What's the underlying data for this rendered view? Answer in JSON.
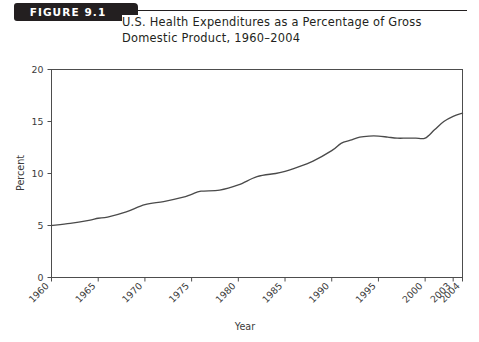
{
  "figure": {
    "badge_label": "FIGURE 9.1",
    "title_line_1": "U.S. Health Expenditures as a Percentage of Gross",
    "title_line_2": "Domestic Product, 1960–2004"
  },
  "colors": {
    "badge_background": "#231f20",
    "badge_text": "#ffffff",
    "title_text": "#231f20",
    "axis": "#4d4d4d",
    "line": "#4a4a4a",
    "background": "#ffffff"
  },
  "chart_data": {
    "type": "line",
    "title": "U.S. Health Expenditures as a Percentage of Gross Domestic Product, 1960–2004",
    "xlabel": "Year",
    "ylabel": "Percent",
    "xlim": [
      1960,
      2004
    ],
    "ylim": [
      0,
      20
    ],
    "grid": false,
    "legend": "none",
    "y_ticks": [
      0,
      5,
      10,
      15,
      20
    ],
    "y_tick_labels": [
      "0",
      "5",
      "10",
      "15",
      "20"
    ],
    "x_ticks": [
      1960,
      1965,
      1970,
      1975,
      1980,
      1985,
      1990,
      1995,
      2000,
      2003,
      2004
    ],
    "x_tick_labels": [
      "1960",
      "1965",
      "1970",
      "1975",
      "1980",
      "1985",
      "1990",
      "1995",
      "2000",
      "2003",
      "2004"
    ],
    "series": [
      {
        "name": "U.S. Health Expenditures as % of GDP",
        "x": [
          1960,
          1962,
          1964,
          1965,
          1966,
          1968,
          1970,
          1972,
          1974,
          1975,
          1976,
          1978,
          1980,
          1982,
          1984,
          1985,
          1986,
          1988,
          1990,
          1991,
          1992,
          1993,
          1994,
          1995,
          1996,
          1997,
          1998,
          1999,
          2000,
          2001,
          2002,
          2003,
          2004
        ],
        "values": [
          5.0,
          5.2,
          5.5,
          5.7,
          5.8,
          6.3,
          7.0,
          7.3,
          7.7,
          8.0,
          8.3,
          8.4,
          8.9,
          9.7,
          10.0,
          10.2,
          10.5,
          11.2,
          12.2,
          12.9,
          13.2,
          13.5,
          13.6,
          13.6,
          13.5,
          13.4,
          13.4,
          13.4,
          13.4,
          14.2,
          15.0,
          15.5,
          15.8
        ]
      }
    ],
    "annotations": []
  }
}
